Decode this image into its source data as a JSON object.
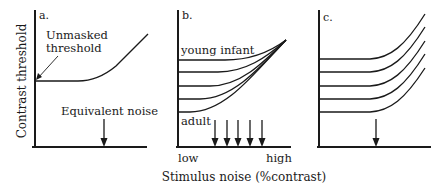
{
  "figure": {
    "y_axis_label": "Contrast threshold",
    "x_axis_label": "Stimulus noise (%contrast)",
    "panels": [
      {
        "id": "a",
        "label": "a.",
        "annotation_threshold_line1": "Unmasked",
        "annotation_threshold_line2": "threshold",
        "annotation_noise": "Equivalent noise"
      },
      {
        "id": "b",
        "label": "b.",
        "curve_top_label": "young infant",
        "curve_bottom_label": "adult",
        "x_low": "low",
        "x_high": "high",
        "arrow_count": 5
      },
      {
        "id": "c",
        "label": "c.",
        "curve_count": 5,
        "arrow_count": 1
      }
    ]
  }
}
